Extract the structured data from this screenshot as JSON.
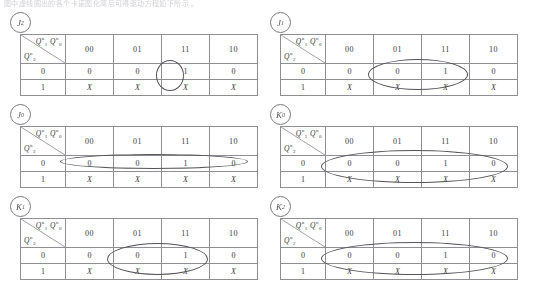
{
  "caption": {
    "text": "图中虚线圈出的各个卡诺图化简后可得驱动方程如下所示 。"
  },
  "table_header": {
    "corner_top": "Q₁ⁿ Q₀ⁿ",
    "corner_bottom": "Q₂ⁿ",
    "corner_top_var1": "Q",
    "corner_top_var1_sup": "n",
    "corner_top_var1_sub": "1",
    "corner_top_var2": "Q",
    "corner_top_var2_sup": "n",
    "corner_top_var2_sub": "0",
    "corner_bottom_var": "Q",
    "corner_bottom_sup": "n",
    "corner_bottom_sub": "2",
    "columns": [
      "00",
      "01",
      "11",
      "10"
    ]
  },
  "kmaps": [
    {
      "id": "j2",
      "label_base": "J",
      "label_sub": "2",
      "row_labels": [
        "0",
        "1"
      ],
      "rows": [
        [
          "0",
          "0",
          "1",
          "0"
        ],
        [
          "X",
          "X",
          "X",
          "X"
        ]
      ],
      "groups": [
        {
          "name": "group-col-11-both-rows",
          "cols": "11",
          "rows": "0-1",
          "shape": "tall-ellipse"
        }
      ]
    },
    {
      "id": "j1",
      "label_base": "J",
      "label_sub": "1",
      "row_labels": [
        "0",
        "1"
      ],
      "rows": [
        [
          "0",
          "0",
          "1",
          "0"
        ],
        [
          "X",
          "X",
          "X",
          "X"
        ]
      ],
      "groups": [
        {
          "name": "group-cols-01-11-both-rows",
          "cols": "01,11",
          "rows": "0-1",
          "shape": "wide-ellipse"
        }
      ]
    },
    {
      "id": "j0",
      "label_base": "J",
      "label_sub": "0",
      "row_labels": [
        "0",
        "1"
      ],
      "rows": [
        [
          "0",
          "0",
          "1",
          "0"
        ],
        [
          "X",
          "X",
          "X",
          "X"
        ]
      ],
      "groups": [
        {
          "name": "group-all-cols-row-0",
          "cols": "00,01,11,10",
          "rows": "0",
          "shape": "flat-ellipse"
        }
      ]
    },
    {
      "id": "k0",
      "label_base": "K",
      "label_sub": "0",
      "row_labels": [
        "0",
        "1"
      ],
      "rows": [
        [
          "0",
          "0",
          "1",
          "0"
        ],
        [
          "X",
          "X",
          "X",
          "X"
        ]
      ],
      "groups": [
        {
          "name": "group-all-cols-both-rows",
          "cols": "00,01,11,10",
          "rows": "0-1",
          "shape": "full-ellipse"
        }
      ]
    },
    {
      "id": "k1",
      "label_base": "K",
      "label_sub": "1",
      "row_labels": [
        "0",
        "1"
      ],
      "rows": [
        [
          "0",
          "0",
          "1",
          "0"
        ],
        [
          "X",
          "X",
          "X",
          "X"
        ]
      ],
      "groups": [
        {
          "name": "group-cols-01-11-both-rows",
          "cols": "01,11",
          "rows": "0-1",
          "shape": "wide-ellipse"
        }
      ]
    },
    {
      "id": "k2",
      "label_base": "K",
      "label_sub": "2",
      "row_labels": [
        "0",
        "1"
      ],
      "rows": [
        [
          "0",
          "0",
          "1",
          "0"
        ],
        [
          "X",
          "X",
          "X",
          "X"
        ]
      ],
      "groups": [
        {
          "name": "group-all-cols-both-rows",
          "cols": "00,01,11,10",
          "rows": "0-1",
          "shape": "full-ellipse"
        }
      ]
    }
  ],
  "colors": {
    "ink": "#3a3a40",
    "rule": "#8e8e94",
    "ellipse": "#555559",
    "caption": "#c9c9cf"
  }
}
